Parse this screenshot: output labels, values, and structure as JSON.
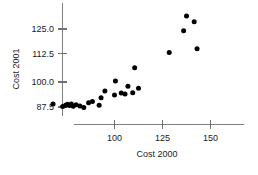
{
  "chart_data": {
    "type": "scatter",
    "title": "",
    "xlabel": "Cost 2000",
    "ylabel": "Cost 2001",
    "xlim": [
      62,
      190
    ],
    "ylim": [
      80.5,
      133
    ],
    "xticks": [
      100,
      125,
      150
    ],
    "xtick_labels": [
      "100",
      "125",
      "150"
    ],
    "yticks": [
      87.5,
      100.0,
      112.5,
      125.0
    ],
    "ytick_labels": [
      "87.5",
      "100.0",
      "112.5",
      "125.0"
    ],
    "grid": false,
    "legend": null,
    "marker": "filled-circle",
    "marker_color": "#000000",
    "points": [
      {
        "x": 68.0,
        "y": 89.0
      },
      {
        "x": 73.0,
        "y": 87.8
      },
      {
        "x": 74.5,
        "y": 88.4
      },
      {
        "x": 75.5,
        "y": 88.8
      },
      {
        "x": 76.5,
        "y": 88.2
      },
      {
        "x": 77.5,
        "y": 88.9
      },
      {
        "x": 78.5,
        "y": 87.9
      },
      {
        "x": 80.0,
        "y": 88.6
      },
      {
        "x": 82.0,
        "y": 88.0
      },
      {
        "x": 84.0,
        "y": 87.3
      },
      {
        "x": 86.5,
        "y": 89.6
      },
      {
        "x": 88.5,
        "y": 90.2
      },
      {
        "x": 92.0,
        "y": 88.3
      },
      {
        "x": 93.0,
        "y": 92.0
      },
      {
        "x": 95.0,
        "y": 95.2
      },
      {
        "x": 100.0,
        "y": 93.3
      },
      {
        "x": 100.5,
        "y": 100.0
      },
      {
        "x": 103.5,
        "y": 94.2
      },
      {
        "x": 105.5,
        "y": 93.7
      },
      {
        "x": 107.0,
        "y": 97.5
      },
      {
        "x": 109.5,
        "y": 94.4
      },
      {
        "x": 110.5,
        "y": 106.4
      },
      {
        "x": 112.5,
        "y": 96.5
      },
      {
        "x": 128.5,
        "y": 113.7
      },
      {
        "x": 136.0,
        "y": 124.2
      },
      {
        "x": 137.5,
        "y": 131.3
      },
      {
        "x": 141.5,
        "y": 128.5
      },
      {
        "x": 143.0,
        "y": 115.5
      },
      {
        "x": 182.0,
        "y": 131.8
      }
    ]
  },
  "axes": {
    "x_axis_name": "x-axis",
    "y_axis_name": "y-axis"
  }
}
